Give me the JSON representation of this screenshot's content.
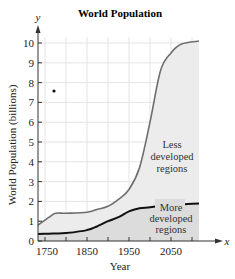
{
  "chart_data": {
    "type": "area",
    "title": "World Population",
    "xlabel": "Year",
    "ylabel": "World Population (billions)",
    "x_axis_var": "x",
    "y_axis_var": "y",
    "xlim": [
      1750,
      2100
    ],
    "ylim": [
      0,
      10
    ],
    "x_ticks": [
      "1750",
      "1850",
      "1950",
      "2050"
    ],
    "y_ticks": [
      "0",
      "1",
      "2",
      "3",
      "4",
      "5",
      "6",
      "7",
      "8",
      "9",
      "10"
    ],
    "grid": true,
    "x": [
      1750,
      1760,
      1775,
      1800,
      1850,
      1875,
      1900,
      1925,
      1950,
      1975,
      2000,
      2025,
      2050,
      2075,
      2100
    ],
    "series": [
      {
        "name": "Less developed regions (total world population curve)",
        "color": "#6e6e6e",
        "values": [
          0.8,
          1.2,
          1.4,
          1.4,
          1.45,
          1.6,
          1.75,
          2.1,
          2.6,
          3.7,
          6.0,
          8.6,
          9.5,
          9.95,
          10.1
        ]
      },
      {
        "name": "More developed regions",
        "color": "#111111",
        "values": [
          0.35,
          0.37,
          0.38,
          0.4,
          0.55,
          0.75,
          1.0,
          1.2,
          1.5,
          1.65,
          1.7,
          1.78,
          1.82,
          1.85,
          1.9
        ]
      }
    ],
    "annotations": [
      {
        "text": "Less developed regions",
        "x": 2070,
        "y": 4.0
      },
      {
        "text": "More developed regions",
        "x": 2070,
        "y": 1.1
      }
    ],
    "marker_point": {
      "x_px": 54,
      "y_px": 91
    }
  },
  "labels": {
    "title": "World Population",
    "xlabel": "Year",
    "ylabel": "World Population (billions)",
    "x_var": "x",
    "y_var": "y",
    "less_line1": "Less",
    "less_line2": "developed",
    "less_line3": "regions",
    "more_line1": "More",
    "more_line2": "developed",
    "more_line3": "regions"
  },
  "colors": {
    "grid": "#e4e4e4",
    "upper_fill": "#ececec",
    "lower_fill": "#dcdcdc",
    "upper_line": "#6e6e6e",
    "lower_line": "#111111",
    "axis": "#333333"
  }
}
